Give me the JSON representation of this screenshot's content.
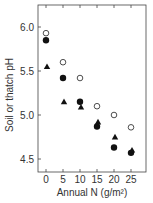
{
  "chart_data": {
    "type": "scatter",
    "title": "",
    "xlabel": "Annual N (g/m²)",
    "ylabel": "Soil or thatch pH",
    "x": [
      0,
      5,
      10,
      15,
      20,
      25
    ],
    "xticks": [
      "0",
      "5",
      "10",
      "15",
      "20",
      "25"
    ],
    "yticks": [
      "4.5",
      "5.0",
      "5.5",
      "6.0"
    ],
    "ylim": [
      4.35,
      6.25
    ],
    "xlim": [
      -2.5,
      27.5
    ],
    "grid": false,
    "legend": null,
    "series": [
      {
        "name": "open circle",
        "marker": "open-circle",
        "values": [
          5.93,
          5.6,
          5.42,
          5.1,
          5.0,
          4.86
        ]
      },
      {
        "name": "filled circle",
        "marker": "filled-circle",
        "values": [
          5.85,
          5.42,
          5.15,
          4.87,
          4.63,
          4.57
        ]
      },
      {
        "name": "filled triangle",
        "marker": "filled-triangle",
        "values": [
          5.55,
          5.15,
          5.09,
          4.92,
          4.75,
          4.6
        ]
      }
    ]
  }
}
